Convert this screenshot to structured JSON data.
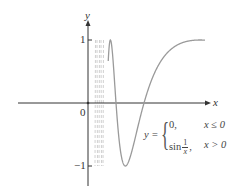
{
  "chart_data": {
    "type": "line",
    "title": "",
    "function": "y = 0 for x <= 0; y = sin(1/x) for x > 0",
    "xlabel": "x",
    "ylabel": "y",
    "xlim": [
      -0.4,
      0.72
    ],
    "ylim": [
      -1.2,
      1.3
    ],
    "grid": false,
    "legend": null,
    "x_ticks": [
      {
        "value": 0,
        "label": "0"
      }
    ],
    "y_ticks": [
      {
        "value": 1,
        "label": "1"
      },
      {
        "value": -1,
        "label": "−1"
      }
    ],
    "series": [
      {
        "name": "sin(1/x)",
        "color": "#9a9a9a",
        "samples": [
          {
            "x": 0.127,
            "y": 1
          },
          {
            "x": 0.159,
            "y": 0
          },
          {
            "x": 0.212,
            "y": -1
          },
          {
            "x": 0.318,
            "y": 0
          },
          {
            "x": 0.637,
            "y": 1
          },
          {
            "x": 0.665,
            "y": 0.997
          }
        ]
      },
      {
        "name": "y = 0 (x <= 0)",
        "color": "#333333",
        "samples": [
          {
            "x": -0.4,
            "y": 0
          },
          {
            "x": 0,
            "y": 0
          }
        ]
      }
    ],
    "annotations": [
      {
        "text": "dense oscillation region near x = 0 drawn as faded dashed lines",
        "x_range": [
          0.04,
          0.09
        ]
      }
    ]
  },
  "labels": {
    "x_axis": "x",
    "y_axis": "y",
    "origin": "0",
    "y_one": "1",
    "y_neg_one": "−1"
  },
  "formula": {
    "lhs": "y =",
    "case1_expr": "0,",
    "case1_cond": "x ≤ 0",
    "case2_prefix": "sin",
    "case2_num": "1",
    "case2_den": "x",
    "case2_suffix": ",",
    "case2_cond": "x > 0"
  },
  "colors": {
    "axis": "#333333",
    "curve": "#9a9a9a",
    "dashed": "#d0d0d0"
  }
}
